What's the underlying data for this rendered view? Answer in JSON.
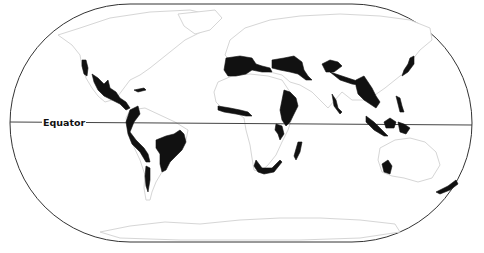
{
  "map": {
    "type": "world map (Robinson-style projection)",
    "frame": {
      "x": 10,
      "y": 4,
      "width": 462,
      "height": 238,
      "rx": 120
    },
    "equator": {
      "label": "Equator",
      "y_left": 122,
      "y_right": 125
    },
    "colors": {
      "highlight": "#111111",
      "land_outline": "#d6d6d6",
      "frame": "#333333",
      "background": "#ffffff"
    },
    "highlighted_regions": [
      "California",
      "Mexico / Central America",
      "Caribbean",
      "Tropical Andes",
      "Chilean coast",
      "Atlantic Forest / Cerrado (Brazil)",
      "Mediterranean Basin",
      "Caucasus / Irano-Anatolian",
      "West African forests",
      "Horn of Africa / Eastern Afromontane",
      "Coastal East Africa",
      "Madagascar",
      "Cape region (South Africa)",
      "Central Asia mountains",
      "Himalaya",
      "Western Ghats / Sri Lanka",
      "Indo-Burma / Southwest China",
      "Japan",
      "Philippines",
      "Sundaland",
      "Wallacea",
      "Southwest Australia",
      "New Zealand"
    ]
  }
}
